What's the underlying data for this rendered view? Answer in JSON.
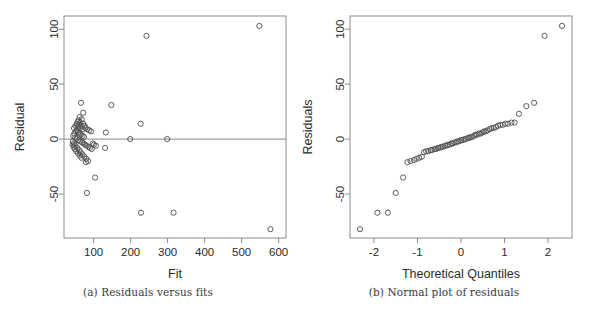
{
  "figure": {
    "panels": [
      {
        "id": "residuals-vs-fits",
        "caption": "(a) Residuals versus fits"
      },
      {
        "id": "normal-plot-of-residuals",
        "caption": "(b) Normal plot of residuals"
      }
    ]
  },
  "chart_data": [
    {
      "type": "scatter",
      "id": "residuals-vs-fits",
      "title": "",
      "xlabel": "Fit",
      "ylabel": "Residual",
      "xlim": [
        20,
        620
      ],
      "ylim": [
        -90,
        112
      ],
      "xticks": [
        100,
        200,
        300,
        400,
        500,
        600
      ],
      "xticklabels": [
        "100",
        "200",
        "300",
        "400",
        "500",
        "600"
      ],
      "yticks": [
        -50,
        0,
        50,
        100
      ],
      "yticklabels": [
        "-50",
        "0",
        "50",
        "100"
      ],
      "grid": false,
      "legend": null,
      "reference_line": {
        "orientation": "horizontal",
        "y": 0
      },
      "marker": "open-circle",
      "points": [
        [
          548,
          103
        ],
        [
          243,
          94
        ],
        [
          578,
          -82
        ],
        [
          228,
          -67
        ],
        [
          316,
          -67
        ],
        [
          66,
          33
        ],
        [
          148,
          31
        ],
        [
          72,
          24
        ],
        [
          227,
          14
        ],
        [
          104,
          -35
        ],
        [
          82,
          -49
        ],
        [
          133,
          6
        ],
        [
          131,
          -8
        ],
        [
          199,
          0
        ],
        [
          299,
          0
        ],
        [
          60,
          13
        ],
        [
          57,
          11
        ],
        [
          63,
          10
        ],
        [
          68,
          12
        ],
        [
          71,
          9
        ],
        [
          55,
          8
        ],
        [
          52,
          7
        ],
        [
          58,
          6
        ],
        [
          62,
          5
        ],
        [
          66,
          4
        ],
        [
          70,
          3
        ],
        [
          74,
          2
        ],
        [
          78,
          10
        ],
        [
          83,
          9
        ],
        [
          88,
          8
        ],
        [
          93,
          7
        ],
        [
          98,
          -4
        ],
        [
          101,
          -5
        ],
        [
          106,
          -6
        ],
        [
          48,
          5
        ],
        [
          45,
          3
        ],
        [
          50,
          1
        ],
        [
          54,
          0
        ],
        [
          59,
          -1
        ],
        [
          64,
          -2
        ],
        [
          69,
          -3
        ],
        [
          73,
          -4
        ],
        [
          77,
          -5
        ],
        [
          81,
          -6
        ],
        [
          86,
          -7
        ],
        [
          90,
          -8
        ],
        [
          95,
          -9
        ],
        [
          44,
          -2
        ],
        [
          47,
          -4
        ],
        [
          51,
          -6
        ],
        [
          56,
          -8
        ],
        [
          61,
          -10
        ],
        [
          65,
          -12
        ],
        [
          70,
          -14
        ],
        [
          75,
          -16
        ],
        [
          80,
          -18
        ],
        [
          85,
          -20
        ],
        [
          79,
          -21
        ],
        [
          67,
          -17
        ],
        [
          63,
          -15
        ],
        [
          58,
          -13
        ],
        [
          53,
          -11
        ],
        [
          49,
          -9
        ],
        [
          46,
          -7
        ],
        [
          43,
          -5
        ],
        [
          60,
          17
        ],
        [
          64,
          15
        ],
        [
          68,
          18
        ],
        [
          72,
          14
        ],
        [
          76,
          12
        ],
        [
          55,
          14
        ],
        [
          51,
          12
        ],
        [
          47,
          10
        ],
        [
          62,
          20
        ],
        [
          57,
          16
        ]
      ]
    },
    {
      "type": "scatter",
      "id": "normal-plot-of-residuals",
      "title": "",
      "xlabel": "Theoretical Quantiles",
      "ylabel": "Residuals",
      "xlim": [
        -2.55,
        2.55
      ],
      "ylim": [
        -90,
        112
      ],
      "xticks": [
        -2,
        -1,
        0,
        1,
        2
      ],
      "xticklabels": [
        "-2",
        "-1",
        "0",
        "1",
        "2"
      ],
      "yticks": [
        -50,
        0,
        50,
        100
      ],
      "yticklabels": [
        "-50",
        "0",
        "50",
        "100"
      ],
      "grid": false,
      "legend": null,
      "marker": "open-circle",
      "points": [
        [
          -2.32,
          -82
        ],
        [
          -1.92,
          -67
        ],
        [
          -1.68,
          -67
        ],
        [
          -1.5,
          -49
        ],
        [
          -1.33,
          -35
        ],
        [
          -1.23,
          -21
        ],
        [
          -1.16,
          -20
        ],
        [
          -1.08,
          -19
        ],
        [
          -1.02,
          -18
        ],
        [
          -0.96,
          -17
        ],
        [
          -0.9,
          -16
        ],
        [
          -0.85,
          -12
        ],
        [
          -0.8,
          -11
        ],
        [
          -0.75,
          -11
        ],
        [
          -0.7,
          -10
        ],
        [
          -0.66,
          -10
        ],
        [
          -0.61,
          -9
        ],
        [
          -0.57,
          -9
        ],
        [
          -0.53,
          -8
        ],
        [
          -0.49,
          -8
        ],
        [
          -0.45,
          -7
        ],
        [
          -0.41,
          -7
        ],
        [
          -0.37,
          -6
        ],
        [
          -0.33,
          -6
        ],
        [
          -0.3,
          -5
        ],
        [
          -0.26,
          -5
        ],
        [
          -0.22,
          -4
        ],
        [
          -0.19,
          -4
        ],
        [
          -0.15,
          -3
        ],
        [
          -0.11,
          -3
        ],
        [
          -0.08,
          -2
        ],
        [
          -0.04,
          -2
        ],
        [
          0.0,
          -1
        ],
        [
          0.04,
          -1
        ],
        [
          0.08,
          0
        ],
        [
          0.11,
          0
        ],
        [
          0.15,
          1
        ],
        [
          0.19,
          1
        ],
        [
          0.22,
          2
        ],
        [
          0.26,
          2
        ],
        [
          0.3,
          3
        ],
        [
          0.33,
          4
        ],
        [
          0.37,
          4
        ],
        [
          0.41,
          5
        ],
        [
          0.45,
          5
        ],
        [
          0.49,
          6
        ],
        [
          0.53,
          7
        ],
        [
          0.57,
          7
        ],
        [
          0.61,
          8
        ],
        [
          0.66,
          9
        ],
        [
          0.7,
          10
        ],
        [
          0.75,
          10
        ],
        [
          0.8,
          11
        ],
        [
          0.85,
          12
        ],
        [
          0.9,
          13
        ],
        [
          0.96,
          13
        ],
        [
          1.02,
          14
        ],
        [
          1.08,
          14
        ],
        [
          1.16,
          15
        ],
        [
          1.23,
          15
        ],
        [
          1.33,
          23
        ],
        [
          1.5,
          30
        ],
        [
          1.68,
          33
        ],
        [
          1.92,
          94
        ],
        [
          2.32,
          103
        ]
      ]
    }
  ]
}
